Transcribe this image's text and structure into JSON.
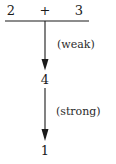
{
  "diagram": {
    "type": "decay-chain",
    "background_color": "#ffffff",
    "stroke_color": "#1a1a1a",
    "text_color": "#1a1a1a",
    "top_expression": {
      "left_operand": "2",
      "operator": "+",
      "right_operand": "3"
    },
    "horizontal_rule": {
      "name": "sum-bar",
      "x_start": 5,
      "x_end": 89,
      "y": 21
    },
    "nodes": [
      {
        "id": "node-four",
        "label": "4",
        "x": 45,
        "y": 79
      },
      {
        "id": "node-one",
        "label": "1",
        "x": 45,
        "y": 150
      }
    ],
    "arrows": [
      {
        "id": "arrow-weak",
        "label": "(weak)",
        "from_y": 21,
        "to_y": 70,
        "x": 45,
        "label_x": 57,
        "label_y": 39
      },
      {
        "id": "arrow-strong",
        "label": "(strong)",
        "from_y": 88,
        "to_y": 141,
        "x": 45,
        "label_x": 56,
        "label_y": 106
      }
    ]
  }
}
